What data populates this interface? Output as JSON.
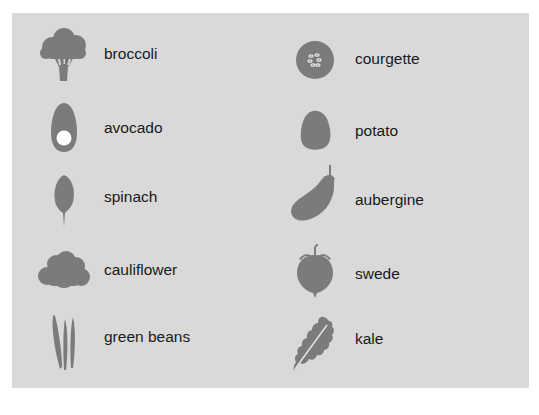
{
  "colors": {
    "background": "#ffffff",
    "panel": "#d9d9d9",
    "icon": "#7b7b7b",
    "text": "#1a1a1a"
  },
  "vegetables": {
    "left": [
      {
        "label": "broccoli",
        "icon": "broccoli-icon"
      },
      {
        "label": "avocado",
        "icon": "avocado-icon"
      },
      {
        "label": "spinach",
        "icon": "spinach-icon"
      },
      {
        "label": "cauliflower",
        "icon": "cauliflower-icon"
      },
      {
        "label": "green beans",
        "icon": "green-beans-icon"
      }
    ],
    "right": [
      {
        "label": "courgette",
        "icon": "courgette-icon"
      },
      {
        "label": "potato",
        "icon": "potato-icon"
      },
      {
        "label": "aubergine",
        "icon": "aubergine-icon"
      },
      {
        "label": "swede",
        "icon": "swede-icon"
      },
      {
        "label": "kale",
        "icon": "kale-icon"
      }
    ]
  }
}
